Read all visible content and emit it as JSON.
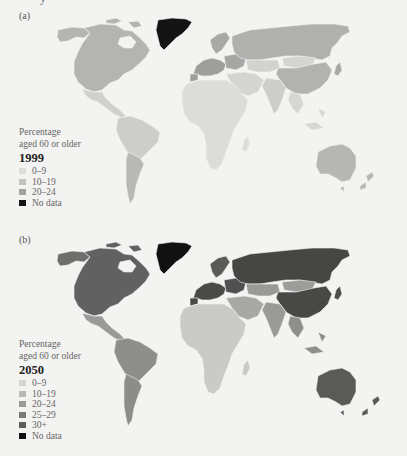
{
  "figure": {
    "top_fragment": "y"
  },
  "panels": [
    {
      "label": "(a)",
      "legend": {
        "title_line1": "Percentage",
        "title_line2": "aged 60 or older",
        "year": "1999",
        "items": [
          {
            "label": "0–9",
            "color": "#dcdcda"
          },
          {
            "label": "10–19",
            "color": "#c2c2c0"
          },
          {
            "label": "20–24",
            "color": "#a2a2a0"
          },
          {
            "label": "No data",
            "color": "#141414"
          }
        ]
      },
      "regions": {
        "north_america_us_canada": "#b4b4b2",
        "alaska": "#b4b4b2",
        "mexico_central_america": "#d0d0ce",
        "greenland": "#141414",
        "south_america": "#cdcdcb",
        "southern_cone": "#b8b8b6",
        "europe_west": "#9e9e9c",
        "europe_east": "#a6a6a4",
        "scandinavia": "#a8a8a6",
        "russia": "#b0b0ae",
        "central_asia": "#d2d2d0",
        "mongolia": "#d4d4d2",
        "china": "#b2b2b0",
        "middle_east": "#d4d4d2",
        "india": "#cdcdcb",
        "southeast_asia": "#d6d6d4",
        "japan": "#a8a8a6",
        "africa": "#dcdcda",
        "australia": "#b6b6b4",
        "new_zealand": "#b6b6b4"
      }
    },
    {
      "label": "(b)",
      "legend": {
        "title_line1": "Percentage",
        "title_line2": "aged 60 or older",
        "year": "2050",
        "items": [
          {
            "label": "0–9",
            "color": "#d6d6d4"
          },
          {
            "label": "10–19",
            "color": "#b8b8b6"
          },
          {
            "label": "20–24",
            "color": "#9a9a98"
          },
          {
            "label": "25–29",
            "color": "#7a7a78"
          },
          {
            "label": "30+",
            "color": "#5e5e5c"
          },
          {
            "label": "No data",
            "color": "#111111"
          }
        ]
      },
      "regions": {
        "north_america_us_canada": "#616161",
        "alaska": "#6e6e6c",
        "mexico_central_america": "#9a9a98",
        "greenland": "#111111",
        "south_america": "#8e8e8c",
        "southern_cone": "#8c8c8a",
        "europe_west": "#4a4a48",
        "europe_east": "#505050",
        "scandinavia": "#5a5a58",
        "russia": "#464644",
        "central_asia": "#9a9a98",
        "mongolia": "#9c9c9a",
        "china": "#484846",
        "middle_east": "#a8a8a6",
        "india": "#9a9a98",
        "southeast_asia": "#8e8e8c",
        "japan": "#4e4e4c",
        "africa": "#cacac8",
        "australia": "#5a5a58",
        "new_zealand": "#5a5a58"
      }
    }
  ]
}
